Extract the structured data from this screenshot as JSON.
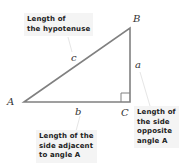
{
  "diagram": {
    "type": "right-triangle",
    "colors": {
      "line": "#808080",
      "text": "#222222",
      "note_bg": "#f4f4f4"
    },
    "vertices": {
      "A": "A",
      "B": "B",
      "C": "C"
    },
    "sides": {
      "hypotenuse": "c",
      "opposite": "a",
      "adjacent": "b"
    },
    "notes": {
      "hypotenuse": [
        "Length of",
        "the hypotenuse"
      ],
      "adjacent": [
        "Length of the",
        "side adjacent",
        "to angle A"
      ],
      "opposite": [
        "Length of",
        "the side",
        "opposite",
        "angle A"
      ]
    }
  }
}
